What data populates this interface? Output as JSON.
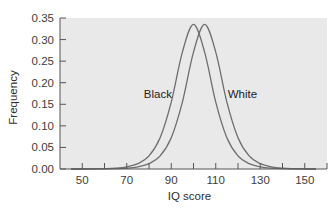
{
  "chart_data": {
    "type": "line",
    "title": "",
    "xlabel": "IQ score",
    "ylabel": "Frequency",
    "xlim": [
      40,
      160
    ],
    "ylim": [
      0,
      0.35
    ],
    "grid": false,
    "legend_position": "inline labels",
    "x_ticks": [
      50,
      60,
      70,
      80,
      90,
      100,
      110,
      120,
      130,
      140,
      150
    ],
    "x_tick_labels": [
      "50",
      "70",
      "90",
      "110",
      "130",
      "150"
    ],
    "y_ticks": [
      0.0,
      0.05,
      0.1,
      0.15,
      0.2,
      0.25,
      0.3,
      0.35
    ],
    "y_tick_labels": [
      "0.00",
      "0.05",
      "0.10",
      "0.15",
      "0.20",
      "0.25",
      "0.30",
      "0.35"
    ],
    "x": [
      45,
      50,
      55,
      60,
      65,
      70,
      75,
      80,
      85,
      90,
      95,
      100,
      105,
      110,
      115,
      120,
      125,
      130,
      135,
      140,
      145,
      150,
      155
    ],
    "series": [
      {
        "name": "Black",
        "color": "#6e6e6e",
        "values": [
          0.0,
          0.0001,
          0.0003,
          0.0008,
          0.0019,
          0.0049,
          0.0123,
          0.0304,
          0.0725,
          0.155,
          0.271,
          0.335,
          0.271,
          0.155,
          0.0725,
          0.0304,
          0.0123,
          0.0049,
          0.0019,
          0.0008,
          0.0003,
          0.0001,
          0.0
        ]
      },
      {
        "name": "White",
        "color": "#6e6e6e",
        "values": [
          0.0,
          0.0,
          0.0001,
          0.0003,
          0.0008,
          0.0019,
          0.0049,
          0.0123,
          0.0304,
          0.0725,
          0.155,
          0.271,
          0.335,
          0.271,
          0.155,
          0.0725,
          0.0304,
          0.0123,
          0.0049,
          0.0019,
          0.0008,
          0.0003,
          0.0001
        ]
      }
    ],
    "annotations": [
      {
        "text": "Black",
        "x": 84,
        "y": 0.175
      },
      {
        "text": "White",
        "x": 122,
        "y": 0.175
      }
    ],
    "colors": {
      "plot_background": "#e9e9e9",
      "axis": "#555555",
      "curve": "#6e6e6e"
    }
  }
}
